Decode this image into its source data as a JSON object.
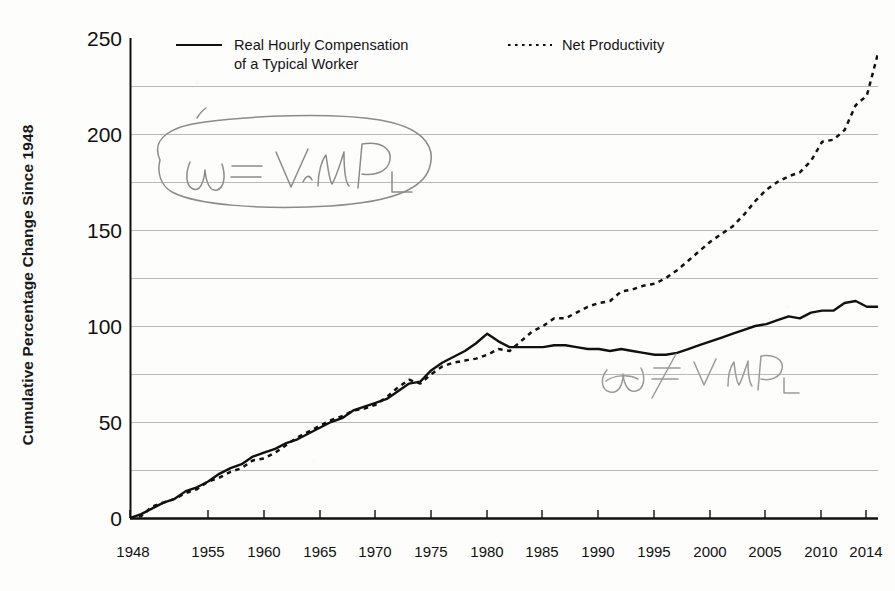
{
  "figure": {
    "background_color": "#fdfdfc",
    "ink_color": "#111111",
    "gridline_color": "#b9b9b9",
    "pencil_color": "#8d8d8f"
  },
  "axes": {
    "ylabel": "Cumulative Percentage Change Since 1948",
    "yticks": [
      "0",
      "50",
      "100",
      "150",
      "200",
      "250"
    ],
    "xticks": [
      "1948",
      "1955",
      "1960",
      "1965",
      "1970",
      "1975",
      "1980",
      "1985",
      "1990",
      "1995",
      "2000",
      "2005",
      "2010",
      "2014"
    ]
  },
  "legend": {
    "entries": [
      {
        "label": "Real Hourly Compensation\nof a Typical Worker",
        "style": "solid"
      },
      {
        "label": "Net Productivity",
        "style": "dotted"
      }
    ]
  },
  "annotations": [
    {
      "name": "circled-equation",
      "text": "ω = V·MPₗ",
      "kind": "handwritten-pencil-circled"
    },
    {
      "name": "inequality-equation",
      "text": "ω ≠ V·MPₗ",
      "kind": "handwritten-pencil"
    }
  ],
  "chart_data": {
    "type": "line",
    "title": "",
    "subtitle": "",
    "xlabel": "",
    "ylabel": "Cumulative Percentage Change Since 1948",
    "xlim": [
      1948,
      2015
    ],
    "ylim": [
      0,
      250
    ],
    "grid": "horizontal-every-25",
    "legend_position": "top-inside",
    "x": [
      1948,
      1949,
      1950,
      1951,
      1952,
      1953,
      1954,
      1955,
      1956,
      1957,
      1958,
      1959,
      1960,
      1961,
      1962,
      1963,
      1964,
      1965,
      1966,
      1967,
      1968,
      1969,
      1970,
      1971,
      1972,
      1973,
      1974,
      1975,
      1976,
      1977,
      1978,
      1979,
      1980,
      1981,
      1982,
      1983,
      1984,
      1985,
      1986,
      1987,
      1988,
      1989,
      1990,
      1991,
      1992,
      1993,
      1994,
      1995,
      1996,
      1997,
      1998,
      1999,
      2000,
      2001,
      2002,
      2003,
      2004,
      2005,
      2006,
      2007,
      2008,
      2009,
      2010,
      2011,
      2012,
      2013,
      2014,
      2015
    ],
    "series": [
      {
        "name": "Real Hourly Compensation of a Typical Worker",
        "style": "solid",
        "color": "#111111",
        "values": [
          0,
          2,
          5,
          8,
          10,
          14,
          16,
          19,
          23,
          26,
          28,
          32,
          34,
          36,
          39,
          41,
          44,
          47,
          50,
          52,
          56,
          58,
          60,
          62,
          66,
          70,
          71,
          77,
          81,
          84,
          87,
          91,
          96,
          92,
          89,
          89,
          89,
          89,
          90,
          90,
          89,
          88,
          88,
          87,
          88,
          87,
          86,
          85,
          85,
          86,
          88,
          90,
          92,
          94,
          96,
          98,
          100,
          101,
          103,
          105,
          104,
          107,
          108,
          108,
          112,
          113,
          110,
          110
        ]
      },
      {
        "name": "Net Productivity",
        "style": "dotted",
        "color": "#111111",
        "values": [
          0,
          1,
          6,
          8,
          10,
          13,
          15,
          19,
          21,
          24,
          26,
          30,
          31,
          34,
          38,
          42,
          45,
          48,
          51,
          53,
          56,
          57,
          59,
          63,
          68,
          72,
          70,
          75,
          79,
          81,
          82,
          83,
          85,
          88,
          87,
          92,
          97,
          100,
          104,
          104,
          107,
          110,
          112,
          113,
          118,
          119,
          121,
          122,
          125,
          129,
          134,
          139,
          144,
          148,
          152,
          158,
          165,
          171,
          175,
          178,
          180,
          186,
          196,
          197,
          202,
          215,
          220,
          242
        ]
      }
    ]
  }
}
